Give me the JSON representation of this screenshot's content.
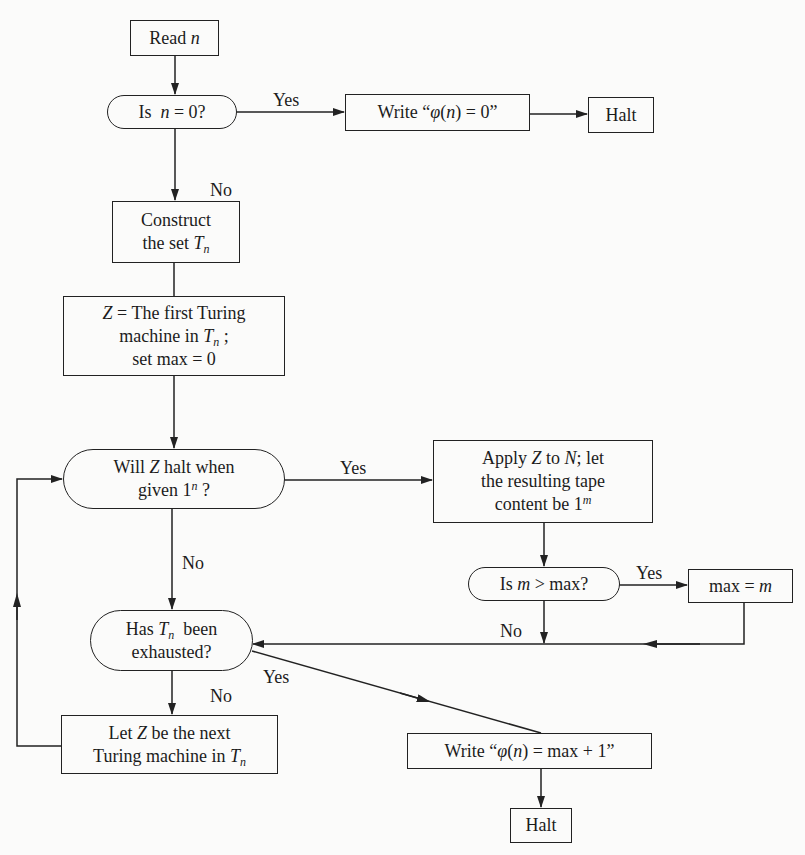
{
  "diagram": {
    "type": "flowchart",
    "nodes": {
      "read_n": {
        "shape": "box",
        "pre": "Read ",
        "var": "n"
      },
      "is_n_zero": {
        "shape": "pill",
        "pre": "Is  ",
        "var": "n",
        "post": " = 0?"
      },
      "write_zero": {
        "shape": "box",
        "pre": "Write “",
        "phi": "φ",
        "open": "(",
        "var": "n",
        "post": ") = 0”"
      },
      "halt_top": {
        "shape": "box",
        "text": "Halt"
      },
      "construct": {
        "shape": "box",
        "line1": "Construct",
        "line2_pre": "the set ",
        "line2_var": "T",
        "line2_sub": "n"
      },
      "init": {
        "shape": "box",
        "line1_var": "Z",
        "line1_post": " = The first Turing",
        "line2_pre": "machine in ",
        "line2_var": "T",
        "line2_sub": "n",
        "line2_post": " ;",
        "line3": "set max = 0"
      },
      "will_halt": {
        "shape": "pill",
        "line1_pre": "Will ",
        "line1_var": "Z",
        "line1_post": " halt when",
        "line2_pre": "given 1",
        "line2_sup": "n",
        "line2_post": " ?"
      },
      "apply": {
        "shape": "box",
        "line1_pre": "Apply ",
        "line1_var1": "Z",
        "line1_mid": " to ",
        "line1_var2": "N",
        "line1_post": "; let",
        "line2": "the resulting tape",
        "line3_pre": "content be 1",
        "line3_sup": "m"
      },
      "is_m_gt_max": {
        "shape": "pill",
        "pre": "Is ",
        "var": "m",
        "post": " > max?"
      },
      "set_max": {
        "shape": "box",
        "pre": "max = ",
        "var": "m"
      },
      "exhausted": {
        "shape": "pill",
        "line1_pre": "Has ",
        "line1_var": "T",
        "line1_sub": "n",
        "line1_post": "  been",
        "line2": "exhausted?"
      },
      "next_z": {
        "shape": "box",
        "line1_pre": "Let ",
        "line1_var": "Z",
        "line1_post": " be the next",
        "line2_pre": "Turing machine in ",
        "line2_var": "T",
        "line2_sub": "n"
      },
      "write_max": {
        "shape": "box",
        "pre": "Write “",
        "phi": "φ",
        "open": "(",
        "var": "n",
        "post": ") = max + 1”"
      },
      "halt_bottom": {
        "shape": "box",
        "text": "Halt"
      }
    },
    "edge_labels": {
      "n_zero_yes": "Yes",
      "n_zero_no": "No",
      "halt_yes": "Yes",
      "halt_no": "No",
      "m_gt_max_yes": "Yes",
      "m_gt_max_no": "No",
      "exhausted_yes": "Yes",
      "exhausted_no": "No"
    },
    "edges": [
      [
        "read_n",
        "is_n_zero"
      ],
      [
        "is_n_zero",
        "write_zero",
        "Yes"
      ],
      [
        "write_zero",
        "halt_top"
      ],
      [
        "is_n_zero",
        "construct",
        "No"
      ],
      [
        "construct",
        "init"
      ],
      [
        "init",
        "will_halt"
      ],
      [
        "will_halt",
        "apply",
        "Yes"
      ],
      [
        "will_halt",
        "exhausted",
        "No"
      ],
      [
        "apply",
        "is_m_gt_max"
      ],
      [
        "is_m_gt_max",
        "set_max",
        "Yes"
      ],
      [
        "is_m_gt_max",
        "exhausted",
        "No"
      ],
      [
        "set_max",
        "exhausted"
      ],
      [
        "exhausted",
        "write_max",
        "Yes"
      ],
      [
        "exhausted",
        "next_z",
        "No"
      ],
      [
        "next_z",
        "will_halt"
      ],
      [
        "write_max",
        "halt_bottom"
      ]
    ],
    "colors": {
      "line": "#222222",
      "background": "#fbfbfa",
      "text": "#1c1c1c"
    }
  }
}
